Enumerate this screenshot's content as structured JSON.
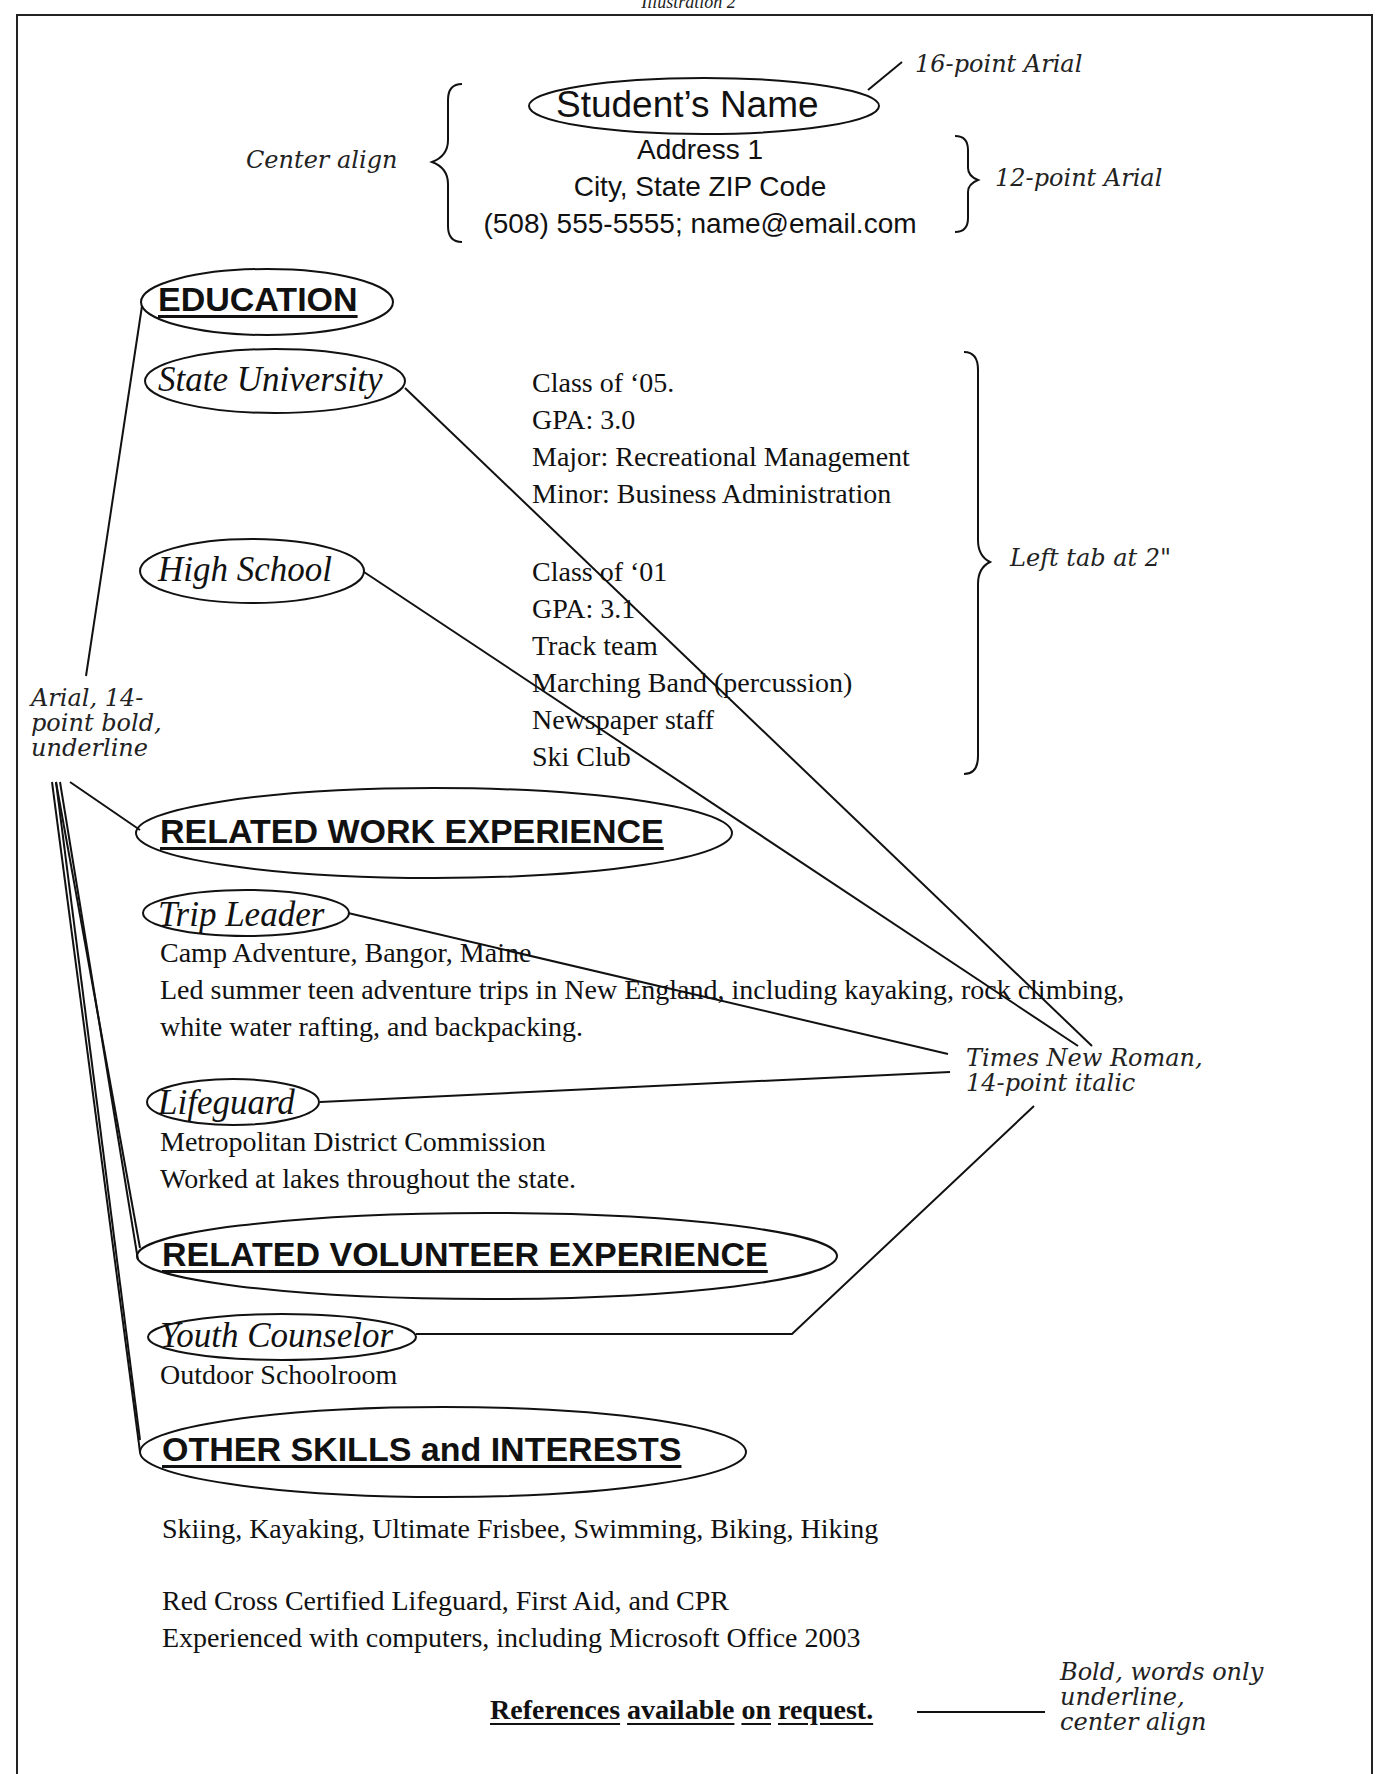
{
  "caption": "Illustration 2",
  "header": {
    "name": "Student’s Name",
    "address_lines": [
      "Address 1",
      "City, State ZIP Code",
      "(508) 555-5555; name@email.com"
    ]
  },
  "education": {
    "heading": "EDUCATION",
    "entries": [
      {
        "school": "State University",
        "details": [
          "Class of ‘05.",
          "GPA: 3.0",
          "Major: Recreational Management",
          "Minor: Business Administration"
        ]
      },
      {
        "school": "High School",
        "details": [
          "Class of ‘01",
          "GPA: 3.1",
          "Track team",
          "Marching Band (percussion)",
          "Newspaper staff",
          "Ski Club"
        ]
      }
    ]
  },
  "work": {
    "heading": "RELATED WORK EXPERIENCE",
    "entries": [
      {
        "title": "Trip Leader",
        "lines": [
          "Camp Adventure, Bangor, Maine",
          "Led summer teen adventure trips in New England, including kayaking, rock climbing,",
          "white water rafting, and backpacking."
        ]
      },
      {
        "title": "Lifeguard",
        "lines": [
          "Metropolitan District Commission",
          "Worked at lakes throughout the state."
        ]
      }
    ]
  },
  "volunteer": {
    "heading": "RELATED VOLUNTEER EXPERIENCE",
    "entries": [
      {
        "title": "Youth Counselor",
        "lines": [
          "Outdoor Schoolroom"
        ]
      }
    ]
  },
  "skills": {
    "heading": "OTHER SKILLS and INTERESTS",
    "lines": [
      "Skiing, Kayaking, Ultimate Frisbee, Swimming, Biking, Hiking",
      "Red Cross Certified Lifeguard, First Aid, and CPR",
      "Experienced with computers, including Microsoft Office 2003"
    ]
  },
  "references": {
    "words": [
      "References",
      "available",
      "on",
      "request."
    ]
  },
  "annotations": {
    "name_font": "16-point Arial",
    "center_align": "Center align",
    "address_font": "12-point Arial",
    "left_tab": "Left tab at 2\"",
    "heading_font": [
      "Arial, 14-",
      "point bold,",
      "underline"
    ],
    "subheading_font": [
      "Times New Roman,",
      "14-point italic"
    ],
    "references_format": [
      "Bold, words only",
      "underline,",
      "center align"
    ]
  }
}
